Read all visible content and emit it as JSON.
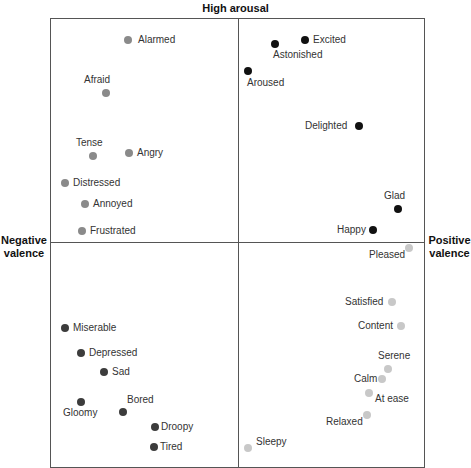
{
  "axes": {
    "top": "High arousal",
    "left": "Negative valence",
    "right": "Positive valence"
  },
  "colors": {
    "neg_high": "#8a8a8a",
    "pos_high": "#111111",
    "neg_low": "#3c3c3c",
    "pos_low": "#c8c8c8"
  },
  "chart_data": {
    "type": "scatter",
    "xlabel_left": "Negative valence",
    "xlabel_right": "Positive valence",
    "ylabel_top": "High arousal",
    "quadrants": [
      "neg_high",
      "pos_high",
      "neg_low",
      "pos_low"
    ],
    "points": [
      {
        "label": "Alarmed",
        "x": 128,
        "y": 40,
        "q": "neg_high",
        "lx": 10,
        "ly": -6
      },
      {
        "label": "Afraid",
        "x": 106,
        "y": 93,
        "q": "neg_high",
        "lx": -22,
        "ly": -19
      },
      {
        "label": "Tense",
        "x": 93,
        "y": 156,
        "q": "neg_high",
        "lx": -17,
        "ly": -19
      },
      {
        "label": "Angry",
        "x": 129,
        "y": 153,
        "q": "neg_high",
        "lx": 8,
        "ly": -6
      },
      {
        "label": "Distressed",
        "x": 65,
        "y": 183,
        "q": "neg_high",
        "lx": 8,
        "ly": -6
      },
      {
        "label": "Annoyed",
        "x": 85,
        "y": 204,
        "q": "neg_high",
        "lx": 8,
        "ly": -6
      },
      {
        "label": "Frustrated",
        "x": 82,
        "y": 231,
        "q": "neg_high",
        "lx": 8,
        "ly": -6
      },
      {
        "label": "Excited",
        "x": 305,
        "y": 40,
        "q": "pos_high",
        "lx": 8,
        "ly": -6
      },
      {
        "label": "Astonished",
        "x": 275,
        "y": 44,
        "q": "pos_high",
        "lx": -2,
        "ly": 5
      },
      {
        "label": "Aroused",
        "x": 248,
        "y": 71,
        "q": "pos_high",
        "lx": -1,
        "ly": 6
      },
      {
        "label": "Delighted",
        "x": 359,
        "y": 126,
        "q": "pos_high",
        "lx": -54,
        "ly": -6
      },
      {
        "label": "Glad",
        "x": 398,
        "y": 209,
        "q": "pos_high",
        "lx": -14,
        "ly": -19
      },
      {
        "label": "Happy",
        "x": 373,
        "y": 230,
        "q": "pos_high",
        "lx": -36,
        "ly": -6
      },
      {
        "label": "Miserable",
        "x": 65,
        "y": 328,
        "q": "neg_low",
        "lx": 8,
        "ly": -6
      },
      {
        "label": "Depressed",
        "x": 81,
        "y": 353,
        "q": "neg_low",
        "lx": 8,
        "ly": -6
      },
      {
        "label": "Sad",
        "x": 104,
        "y": 372,
        "q": "neg_low",
        "lx": 8,
        "ly": -6
      },
      {
        "label": "Gloomy",
        "x": 81,
        "y": 402,
        "q": "neg_low",
        "lx": -18,
        "ly": 5
      },
      {
        "label": "Bored",
        "x": 123,
        "y": 412,
        "q": "neg_low",
        "lx": 4,
        "ly": -18
      },
      {
        "label": "Droopy",
        "x": 155,
        "y": 427,
        "q": "neg_low",
        "lx": 6,
        "ly": -6
      },
      {
        "label": "Tired",
        "x": 154,
        "y": 447,
        "q": "neg_low",
        "lx": 6,
        "ly": -6
      },
      {
        "label": "Pleased",
        "x": 409,
        "y": 248,
        "q": "pos_low",
        "lx": -40,
        "ly": 1
      },
      {
        "label": "Satisfied",
        "x": 392,
        "y": 302,
        "q": "pos_low",
        "lx": -47,
        "ly": -6
      },
      {
        "label": "Content",
        "x": 401,
        "y": 326,
        "q": "pos_low",
        "lx": -43,
        "ly": -6
      },
      {
        "label": "Serene",
        "x": 388,
        "y": 369,
        "q": "pos_low",
        "lx": -10,
        "ly": -19
      },
      {
        "label": "Calm",
        "x": 382,
        "y": 379,
        "q": "pos_low",
        "lx": -28,
        "ly": -6
      },
      {
        "label": "At ease",
        "x": 369,
        "y": 393,
        "q": "pos_low",
        "lx": 6,
        "ly": 0
      },
      {
        "label": "Relaxed",
        "x": 367,
        "y": 415,
        "q": "pos_low",
        "lx": -41,
        "ly": 1
      },
      {
        "label": "Sleepy",
        "x": 248,
        "y": 448,
        "q": "pos_low",
        "lx": 8,
        "ly": -12
      }
    ]
  }
}
